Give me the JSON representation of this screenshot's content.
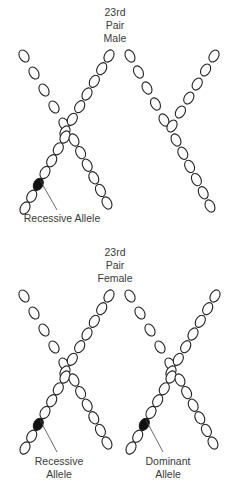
{
  "diagram": {
    "sections": [
      {
        "id": "male",
        "title_lines": [
          "23rd",
          "Pair",
          "Male"
        ],
        "chromosomes": [
          {
            "name": "x-chromosome",
            "type": "X",
            "marked_allele": "Recessive Allele"
          },
          {
            "name": "y-chromosome",
            "type": "Y",
            "marked_allele": null
          }
        ],
        "labels": [
          {
            "name": "recessive-allele-label",
            "lines": [
              "Recessive Allele"
            ]
          }
        ]
      },
      {
        "id": "female",
        "title_lines": [
          "23rd",
          "Pair",
          "Female"
        ],
        "chromosomes": [
          {
            "name": "x-chromosome-1",
            "type": "X",
            "marked_allele": "Recessive Allele"
          },
          {
            "name": "x-chromosome-2",
            "type": "X",
            "marked_allele": "Dominant Allele"
          }
        ],
        "labels": [
          {
            "name": "recessive-allele-label",
            "lines": [
              "Recessive",
              "Allele"
            ]
          },
          {
            "name": "dominant-allele-label",
            "lines": [
              "Dominant",
              "Allele"
            ]
          }
        ]
      }
    ],
    "colors": {
      "outline": "#222222",
      "allele_fill": "#111111",
      "text": "#3a3a3a"
    }
  }
}
